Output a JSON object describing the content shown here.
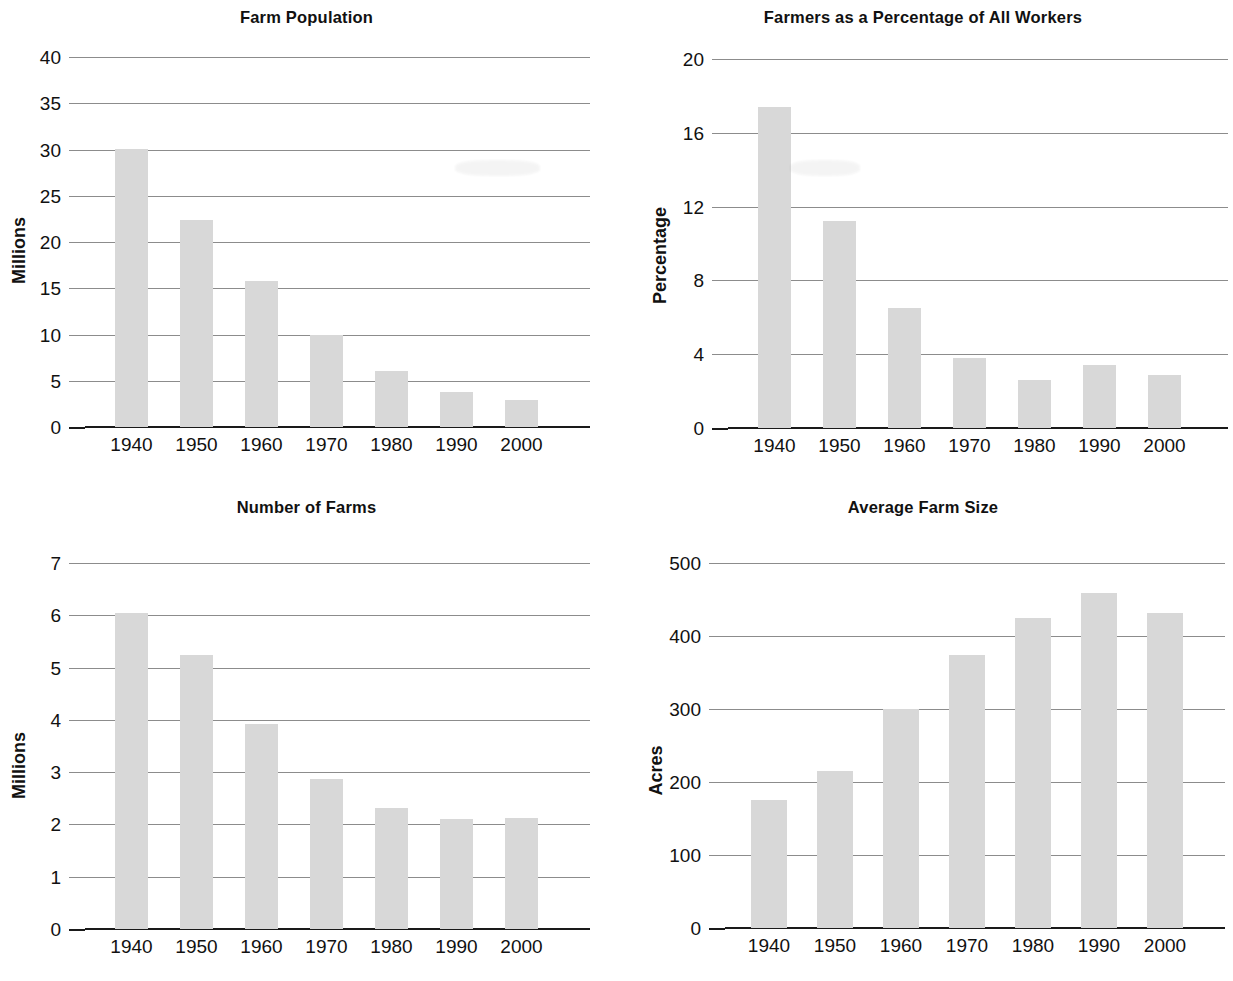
{
  "figure": {
    "panel_count": 4,
    "bar_color": "#d8d8d8",
    "axis_color": "#1a1a1a",
    "grid_color": "#8c8c8c"
  },
  "chart_data": [
    {
      "type": "bar",
      "title": "Farm Population",
      "xlabel": "",
      "ylabel": "Millions",
      "categories": [
        "1940",
        "1950",
        "1960",
        "1970",
        "1980",
        "1990",
        "2000"
      ],
      "values": [
        30.1,
        22.4,
        15.8,
        9.9,
        6.1,
        3.8,
        2.9
      ],
      "ylim": [
        0,
        40
      ],
      "yticks": [
        "0",
        "5",
        "10",
        "15",
        "20",
        "25",
        "30",
        "35",
        "40"
      ],
      "ytick_values": [
        0,
        5,
        10,
        15,
        20,
        25,
        30,
        35,
        40
      ],
      "grid": true,
      "legend": "none"
    },
    {
      "type": "bar",
      "title": "Farmers as a Percentage of All Workers",
      "xlabel": "",
      "ylabel": "Percentage",
      "categories": [
        "1940",
        "1950",
        "1960",
        "1970",
        "1980",
        "1990",
        "2000"
      ],
      "values": [
        17.4,
        11.2,
        6.5,
        3.8,
        2.6,
        3.4,
        2.85
      ],
      "ylim": [
        0,
        20
      ],
      "yticks": [
        "0",
        "4",
        "8",
        "12",
        "16",
        "20"
      ],
      "ytick_values": [
        0,
        4,
        8,
        12,
        16,
        20
      ],
      "grid": true,
      "legend": "none"
    },
    {
      "type": "bar",
      "title": "Number of Farms",
      "xlabel": "",
      "ylabel": "Millions",
      "categories": [
        "1940",
        "1950",
        "1960",
        "1970",
        "1980",
        "1990",
        "2000"
      ],
      "values": [
        6.05,
        5.25,
        3.93,
        2.87,
        2.32,
        2.1,
        2.13
      ],
      "ylim": [
        0,
        7
      ],
      "yticks": [
        "0",
        "1",
        "2",
        "3",
        "4",
        "5",
        "6",
        "7"
      ],
      "ytick_values": [
        0,
        1,
        2,
        3,
        4,
        5,
        6,
        7
      ],
      "grid": true,
      "legend": "none"
    },
    {
      "type": "bar",
      "title": "Average Farm Size",
      "xlabel": "",
      "ylabel": "Acres",
      "categories": [
        "1940",
        "1950",
        "1960",
        "1970",
        "1980",
        "1990",
        "2000"
      ],
      "values": [
        175,
        215,
        300,
        374,
        425,
        459,
        432
      ],
      "ylim": [
        0,
        500
      ],
      "yticks": [
        "0",
        "100",
        "200",
        "300",
        "400",
        "500"
      ],
      "ytick_values": [
        0,
        100,
        200,
        300,
        400,
        500
      ],
      "grid": true,
      "legend": "none"
    }
  ]
}
